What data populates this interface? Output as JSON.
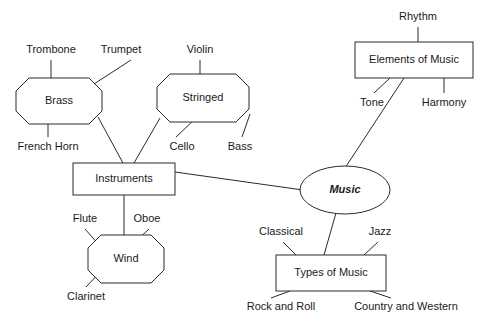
{
  "diagram": {
    "type": "concept-map",
    "canvas": {
      "width": 487,
      "height": 329
    },
    "style": {
      "background": "#ffffff",
      "line_color": "#2b2b2b",
      "text_color": "#1a1a1a",
      "node_fill": "#ffffff",
      "font_size": 11
    },
    "nodes": [
      {
        "id": "brass",
        "label": "Brass",
        "shape": "octagon",
        "x": 16,
        "y": 78,
        "w": 86,
        "h": 46,
        "cut": 13,
        "emphasis": false
      },
      {
        "id": "stringed",
        "label": "Stringed",
        "shape": "octagon",
        "x": 157,
        "y": 74,
        "w": 92,
        "h": 48,
        "cut": 13,
        "emphasis": false
      },
      {
        "id": "instruments",
        "label": "Instruments",
        "shape": "rect",
        "x": 73,
        "y": 163,
        "w": 102,
        "h": 32,
        "cut": 0,
        "emphasis": false
      },
      {
        "id": "wind",
        "label": "Wind",
        "shape": "octagon",
        "x": 88,
        "y": 235,
        "w": 76,
        "h": 48,
        "cut": 13,
        "emphasis": false
      },
      {
        "id": "music",
        "label": "Music",
        "shape": "ellipse",
        "x": 300,
        "y": 166,
        "w": 90,
        "h": 48,
        "cut": 0,
        "emphasis": true
      },
      {
        "id": "elements-of-music",
        "label": "Elements of Music",
        "shape": "rect",
        "x": 355,
        "y": 42,
        "w": 118,
        "h": 36,
        "cut": 0,
        "emphasis": false
      },
      {
        "id": "types-of-music",
        "label": "Types of Music",
        "shape": "rect",
        "x": 276,
        "y": 255,
        "w": 110,
        "h": 36,
        "cut": 0,
        "emphasis": false
      }
    ],
    "leaves": [
      {
        "id": "trombone",
        "label": "Trombone",
        "x": 51,
        "y": 50,
        "anchor": "middle"
      },
      {
        "id": "trumpet",
        "label": "Trumpet",
        "x": 121,
        "y": 50,
        "anchor": "middle"
      },
      {
        "id": "french-horn",
        "label": "French Horn",
        "x": 48,
        "y": 147,
        "anchor": "middle"
      },
      {
        "id": "violin",
        "label": "Violin",
        "x": 200,
        "y": 50,
        "anchor": "middle"
      },
      {
        "id": "cello",
        "label": "Cello",
        "x": 182,
        "y": 147,
        "anchor": "middle"
      },
      {
        "id": "bass",
        "label": "Bass",
        "x": 240,
        "y": 147,
        "anchor": "middle"
      },
      {
        "id": "flute",
        "label": "Flute",
        "x": 85,
        "y": 219,
        "anchor": "middle"
      },
      {
        "id": "oboe",
        "label": "Oboe",
        "x": 147,
        "y": 219,
        "anchor": "middle"
      },
      {
        "id": "clarinet",
        "label": "Clarinet",
        "x": 86,
        "y": 297,
        "anchor": "middle"
      },
      {
        "id": "rhythm",
        "label": "Rhythm",
        "x": 418,
        "y": 17,
        "anchor": "middle"
      },
      {
        "id": "tone",
        "label": "Tone",
        "x": 372,
        "y": 103,
        "anchor": "middle"
      },
      {
        "id": "harmony",
        "label": "Harmony",
        "x": 444,
        "y": 103,
        "anchor": "middle"
      },
      {
        "id": "classical",
        "label": "Classical",
        "x": 281,
        "y": 232,
        "anchor": "middle"
      },
      {
        "id": "jazz",
        "label": "Jazz",
        "x": 380,
        "y": 232,
        "anchor": "middle"
      },
      {
        "id": "rock-and-roll",
        "label": "Rock and Roll",
        "x": 281,
        "y": 307,
        "anchor": "middle"
      },
      {
        "id": "country-and-western",
        "label": "Country and Western",
        "x": 406,
        "y": 307,
        "anchor": "middle"
      }
    ],
    "edges": [
      {
        "id": "trombone-brass",
        "from": "trombone",
        "to": "brass",
        "x1": 51,
        "y1": 60,
        "x2": 51,
        "y2": 78
      },
      {
        "id": "trumpet-brass",
        "from": "trumpet",
        "to": "brass",
        "x1": 131,
        "y1": 60,
        "x2": 94,
        "y2": 84
      },
      {
        "id": "frenchhorn-brass",
        "from": "french-horn",
        "to": "brass",
        "x1": 48,
        "y1": 137,
        "x2": 48,
        "y2": 124
      },
      {
        "id": "violin-stringed",
        "from": "violin",
        "to": "stringed",
        "x1": 200,
        "y1": 60,
        "x2": 200,
        "y2": 74
      },
      {
        "id": "cello-stringed",
        "from": "cello",
        "to": "stringed",
        "x1": 176,
        "y1": 137,
        "x2": 196,
        "y2": 118
      },
      {
        "id": "bass-stringed",
        "from": "bass",
        "to": "stringed",
        "x1": 242,
        "y1": 137,
        "x2": 250,
        "y2": 114
      },
      {
        "id": "brass-instruments",
        "from": "brass",
        "to": "instruments",
        "x1": 98,
        "y1": 117,
        "x2": 123,
        "y2": 163
      },
      {
        "id": "stringed-instruments",
        "from": "stringed",
        "to": "instruments",
        "x1": 160,
        "y1": 118,
        "x2": 134,
        "y2": 163
      },
      {
        "id": "instruments-wind",
        "from": "instruments",
        "to": "wind",
        "x1": 124,
        "y1": 195,
        "x2": 124,
        "y2": 235
      },
      {
        "id": "flute-wind",
        "from": "flute",
        "to": "wind",
        "x1": 85,
        "y1": 229,
        "x2": 100,
        "y2": 246
      },
      {
        "id": "oboe-wind",
        "from": "oboe",
        "to": "wind",
        "x1": 149,
        "y1": 229,
        "x2": 137,
        "y2": 240
      },
      {
        "id": "clarinet-wind",
        "from": "clarinet",
        "to": "wind",
        "x1": 86,
        "y1": 287,
        "x2": 101,
        "y2": 271
      },
      {
        "id": "instruments-music",
        "from": "instruments",
        "to": "music",
        "x1": 175,
        "y1": 172,
        "x2": 303,
        "y2": 190
      },
      {
        "id": "rhythm-elements",
        "from": "rhythm",
        "to": "elements-of-music",
        "x1": 418,
        "y1": 27,
        "x2": 418,
        "y2": 42
      },
      {
        "id": "tone-elements",
        "from": "tone",
        "to": "elements-of-music",
        "x1": 374,
        "y1": 93,
        "x2": 390,
        "y2": 78
      },
      {
        "id": "harmony-elements",
        "from": "harmony",
        "to": "elements-of-music",
        "x1": 444,
        "y1": 93,
        "x2": 444,
        "y2": 78
      },
      {
        "id": "elements-music",
        "from": "elements-of-music",
        "to": "music",
        "x1": 404,
        "y1": 78,
        "x2": 345,
        "y2": 168
      },
      {
        "id": "music-types",
        "from": "music",
        "to": "types-of-music",
        "x1": 336,
        "y1": 213,
        "x2": 324,
        "y2": 255
      },
      {
        "id": "classical-types",
        "from": "classical",
        "to": "types-of-music",
        "x1": 283,
        "y1": 242,
        "x2": 296,
        "y2": 255
      },
      {
        "id": "jazz-types",
        "from": "jazz",
        "to": "types-of-music",
        "x1": 378,
        "y1": 242,
        "x2": 364,
        "y2": 255
      },
      {
        "id": "types-rockandroll",
        "from": "types-of-music",
        "to": "rock-and-roll",
        "x1": 290,
        "y1": 291,
        "x2": 271,
        "y2": 298
      },
      {
        "id": "types-countryandwestern",
        "from": "types-of-music",
        "to": "country-and-western",
        "x1": 370,
        "y1": 291,
        "x2": 391,
        "y2": 298
      }
    ]
  }
}
